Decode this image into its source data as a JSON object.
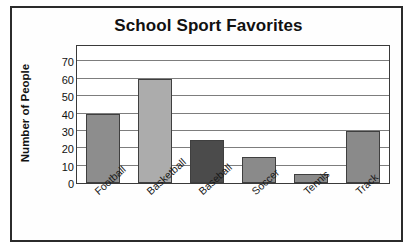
{
  "chart_data": {
    "type": "bar",
    "title": "School Sport Favorites",
    "xlabel": "",
    "ylabel": "Number of People",
    "categories": [
      "Football",
      "Basketball",
      "Baseball",
      "Soccer",
      "Tennis",
      "Track"
    ],
    "values": [
      40,
      60,
      25,
      15,
      5,
      30
    ],
    "ylim": [
      0,
      80
    ],
    "ytick_labels": [
      "0",
      "10",
      "20",
      "30",
      "40",
      "50",
      "60",
      "70"
    ],
    "ytick_values": [
      0,
      10,
      20,
      30,
      40,
      50,
      60,
      70
    ],
    "grid": true,
    "legend": "none",
    "bar_colors": [
      "#8d8d8d",
      "#acacac",
      "#4b4b4b",
      "#8a8a8a",
      "#8a8a8a",
      "#8a8a8a"
    ],
    "bar_border_color": "#3f3f3f",
    "gridline_color": "#7d7d7d",
    "axis_color": "#3a3a3a",
    "frame_color": "#2b2b2b",
    "text_color": "#111111"
  }
}
